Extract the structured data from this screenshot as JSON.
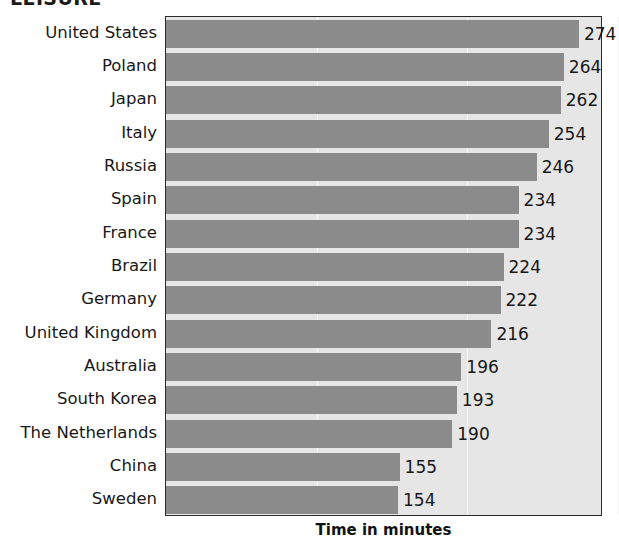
{
  "chart_data": {
    "type": "bar",
    "orientation": "horizontal",
    "title": "LEISURE",
    "subtitle": "",
    "xlabel": "Time in minutes",
    "ylabel": "",
    "categories": [
      "United States",
      "Poland",
      "Japan",
      "Italy",
      "Russia",
      "Spain",
      "France",
      "Brazil",
      "Germany",
      "United Kingdom",
      "Australia",
      "South Korea",
      "The Netherlands",
      "China",
      "Sweden"
    ],
    "values": [
      274,
      264,
      262,
      254,
      246,
      234,
      234,
      224,
      222,
      216,
      196,
      193,
      190,
      155,
      154
    ],
    "value_labels": [
      "274",
      "264",
      "262",
      "254",
      "246",
      "234",
      "234",
      "224",
      "222",
      "216",
      "196",
      "193",
      "190",
      "155",
      "154"
    ],
    "xlim": [
      0,
      290
    ],
    "gridlines": [
      100,
      200,
      300
    ],
    "grid": true,
    "legend": null,
    "legend_position": "none",
    "bar_color": "#8b8b8b",
    "plot_background": "#e6e6e6",
    "axis_color": "#2b2b2b",
    "gridline_color": "#f4f4f4",
    "text_color": "#181818",
    "tick_labels_x": [],
    "tick_labels_y": [
      "United States",
      "Poland",
      "Japan",
      "Italy",
      "Russia",
      "Spain",
      "France",
      "Brazil",
      "Germany",
      "United Kingdom",
      "Australia",
      "South Korea",
      "The Netherlands",
      "China",
      "Sweden"
    ],
    "annotations": []
  }
}
